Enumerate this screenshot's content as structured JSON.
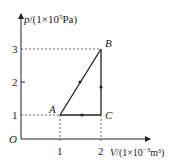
{
  "diagram": {
    "type": "p-V cycle diagram",
    "y_axis": {
      "symbol": "p",
      "unit_prefix": "/(1×10",
      "unit_exp": "5",
      "unit_suffix": "Pa)",
      "ticks": [
        "1",
        "2",
        "3"
      ]
    },
    "x_axis": {
      "symbol": "V",
      "unit_prefix": "/(1×10",
      "unit_exp": "−3",
      "unit_suffix": "m³)",
      "ticks": [
        "1",
        "2"
      ]
    },
    "origin_label": "O",
    "points": [
      {
        "name": "A",
        "V": 1,
        "p": 1
      },
      {
        "name": "B",
        "V": 2,
        "p": 3
      },
      {
        "name": "C",
        "V": 2,
        "p": 1
      }
    ],
    "cycle": [
      "A→B",
      "B→C",
      "C→A"
    ],
    "line_color": "#222222"
  }
}
